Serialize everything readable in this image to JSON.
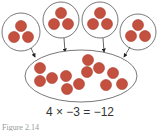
{
  "colors": {
    "dot_fill": "#c4503f",
    "dot_stroke": "#a83c2e",
    "outline": "#555555",
    "arrow": "#222222"
  },
  "groups": [
    {
      "cx": 21,
      "cy": 32,
      "r": 19,
      "dots": [
        [
          21,
          26
        ],
        [
          14,
          37
        ],
        [
          28,
          37
        ]
      ]
    },
    {
      "cx": 61,
      "cy": 20,
      "r": 18,
      "dots": [
        [
          61,
          13
        ],
        [
          54,
          24
        ],
        [
          68,
          24
        ]
      ]
    },
    {
      "cx": 100,
      "cy": 20,
      "r": 18,
      "dots": [
        [
          100,
          13
        ],
        [
          93,
          24
        ],
        [
          107,
          24
        ]
      ]
    },
    {
      "cx": 138,
      "cy": 32,
      "r": 18,
      "dots": [
        [
          138,
          25
        ],
        [
          131,
          36
        ],
        [
          145,
          36
        ]
      ]
    }
  ],
  "result_set": {
    "cx": 81,
    "cy": 76,
    "rx": 56,
    "ry": 26,
    "dots": [
      [
        40,
        68
      ],
      [
        40,
        81
      ],
      [
        52,
        78
      ],
      [
        66,
        76
      ],
      [
        67,
        89
      ],
      [
        79,
        84
      ],
      [
        87,
        72
      ],
      [
        88,
        60
      ],
      [
        99,
        68
      ],
      [
        113,
        73
      ],
      [
        106,
        85
      ],
      [
        122,
        84
      ]
    ]
  },
  "equation": "4 × −3 = −12",
  "caption": "Figure 2.14"
}
